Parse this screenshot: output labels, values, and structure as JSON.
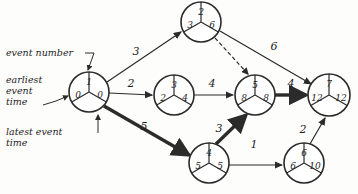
{
  "diagram": {
    "type": "pert-cpm-network",
    "annotations": [
      {
        "id": "event-number",
        "text": "event number",
        "x": 6,
        "y": 56
      },
      {
        "id": "earliest-line1",
        "text": "earliest",
        "x": 6,
        "y": 83
      },
      {
        "id": "earliest-line2",
        "text": "event",
        "x": 6,
        "y": 94
      },
      {
        "id": "earliest-line3",
        "text": "time",
        "x": 6,
        "y": 105
      },
      {
        "id": "latest-line1",
        "text": "latest event",
        "x": 6,
        "y": 135
      },
      {
        "id": "latest-line2",
        "text": "time",
        "x": 6,
        "y": 146
      }
    ],
    "nodes": [
      {
        "id": "n1",
        "event": "1",
        "earliest": "0",
        "latest": "0",
        "cx": 89,
        "cy": 92,
        "r": 20,
        "critical": true
      },
      {
        "id": "n2",
        "event": "2",
        "earliest": "3",
        "latest": "6",
        "cx": 201,
        "cy": 22,
        "r": 20,
        "critical": false
      },
      {
        "id": "n3",
        "event": "3",
        "earliest": "2",
        "latest": "4",
        "cx": 174,
        "cy": 95,
        "r": 20,
        "critical": false
      },
      {
        "id": "n4",
        "event": "4",
        "earliest": "5",
        "latest": "5",
        "cx": 209,
        "cy": 163,
        "r": 20,
        "critical": true
      },
      {
        "id": "n5",
        "event": "5",
        "earliest": "8",
        "latest": "8",
        "cx": 255,
        "cy": 95,
        "r": 20,
        "critical": true
      },
      {
        "id": "n6",
        "event": "6",
        "earliest": "6",
        "latest": "10",
        "cx": 304,
        "cy": 163,
        "r": 20,
        "critical": false
      },
      {
        "id": "n7",
        "event": "7",
        "earliest": "12",
        "latest": "12",
        "cx": 329,
        "cy": 95,
        "r": 21,
        "critical": true
      }
    ],
    "edges": [
      {
        "id": "e1-2",
        "from": "1",
        "to": "2",
        "duration": "3",
        "style": "solid",
        "critical": false,
        "label_x": 136,
        "label_y": 55
      },
      {
        "id": "e1-3",
        "from": "1",
        "to": "3",
        "duration": "2",
        "style": "solid",
        "critical": false,
        "label_x": 131,
        "label_y": 87
      },
      {
        "id": "e1-4",
        "from": "1",
        "to": "4",
        "duration": "5",
        "style": "solid",
        "critical": true,
        "label_x": 144,
        "label_y": 130
      },
      {
        "id": "e2-5",
        "from": "2",
        "to": "5",
        "duration": "",
        "style": "dashed",
        "critical": false,
        "label_x": 0,
        "label_y": 0
      },
      {
        "id": "e2-7",
        "from": "2",
        "to": "7",
        "duration": "6",
        "style": "solid",
        "critical": false,
        "label_x": 274,
        "label_y": 50
      },
      {
        "id": "e3-5",
        "from": "3",
        "to": "5",
        "duration": "4",
        "style": "solid",
        "critical": false,
        "label_x": 212,
        "label_y": 87
      },
      {
        "id": "e4-5",
        "from": "4",
        "to": "5",
        "duration": "3",
        "style": "solid",
        "critical": true,
        "label_x": 219,
        "label_y": 132
      },
      {
        "id": "e4-6",
        "from": "4",
        "to": "6",
        "duration": "1",
        "style": "solid",
        "critical": false,
        "label_x": 254,
        "label_y": 148
      },
      {
        "id": "e5-7",
        "from": "5",
        "to": "7",
        "duration": "4",
        "style": "solid",
        "critical": true,
        "label_x": 291,
        "label_y": 87
      },
      {
        "id": "e6-7",
        "from": "6",
        "to": "7",
        "duration": "2",
        "style": "solid",
        "critical": false,
        "label_x": 303,
        "label_y": 133
      }
    ],
    "legend_note": "Each circle is split into three sectors: event number on top, earliest event time on the left, latest event time on the right."
  }
}
